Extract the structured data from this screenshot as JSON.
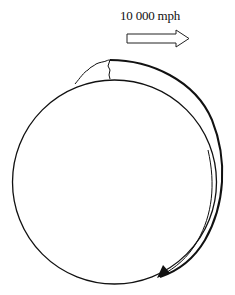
{
  "figure": {
    "top_caption_fragment": "",
    "speed_label": "10 000 mph",
    "direction_arrow": {
      "style": "hollow-block-arrow",
      "direction": "right"
    },
    "body": {
      "shape": "circle",
      "center": [
        114,
        182
      ],
      "radius": 102
    },
    "bulge": {
      "description": "outer arc pulled away from the circle along the top-right, with a crack at the top",
      "arrow_direction": "clockwise-down"
    },
    "colors": {
      "stroke": "#111111",
      "background": "#ffffff"
    }
  }
}
